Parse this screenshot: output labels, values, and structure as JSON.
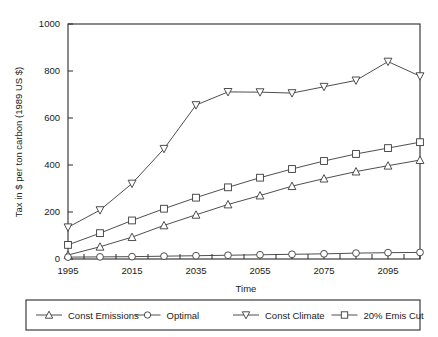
{
  "chart_data": {
    "type": "line",
    "title": "",
    "xlabel": "Time",
    "ylabel": "Tax in $ per ton carbon (1989 US $)",
    "xlim": [
      1995,
      2105
    ],
    "ylim": [
      0,
      1000
    ],
    "xticks": [
      1995,
      2015,
      2035,
      2055,
      2075,
      2095
    ],
    "xtick_labels": [
      "1995",
      "2015",
      "2035",
      "2055",
      "2075",
      "2095"
    ],
    "yticks": [
      0,
      200,
      400,
      600,
      800,
      1000
    ],
    "ytick_labels": [
      "0",
      "200",
      "400",
      "600",
      "800",
      "1000"
    ],
    "minor_xtick_step": 5,
    "grid": false,
    "legend_position": "below-outside",
    "x": [
      1995,
      2005,
      2015,
      2025,
      2035,
      2045,
      2055,
      2065,
      2075,
      2085,
      2095,
      2105
    ],
    "series": [
      {
        "name": "Const Emissions",
        "marker": "triangle-up",
        "values": [
          17,
          52,
          93,
          143,
          188,
          232,
          270,
          310,
          342,
          372,
          397,
          421
        ]
      },
      {
        "name": "Optimal",
        "marker": "circle",
        "values": [
          8,
          9,
          10,
          12,
          14,
          16,
          18,
          20,
          22,
          25,
          27,
          28
        ]
      },
      {
        "name": "Const Climate",
        "marker": "triangle-down",
        "values": [
          135,
          208,
          321,
          469,
          655,
          711,
          710,
          706,
          733,
          760,
          840,
          778
        ]
      },
      {
        "name": "20% Emis Cut",
        "marker": "square",
        "values": [
          60,
          110,
          164,
          214,
          261,
          305,
          346,
          383,
          417,
          447,
          472,
          497
        ]
      }
    ]
  },
  "legend": {
    "entries": [
      {
        "label": "Const Emissions",
        "marker": "triangle-up"
      },
      {
        "label": "Optimal",
        "marker": "circle"
      },
      {
        "label": "Const Climate",
        "marker": "triangle-down"
      },
      {
        "label": "20% Emis Cut",
        "marker": "square"
      }
    ]
  },
  "colors": {
    "line": "#3a3a3a",
    "axis": "#2b2b2b",
    "marker_fill": "#ffffff",
    "background": "#ffffff"
  }
}
